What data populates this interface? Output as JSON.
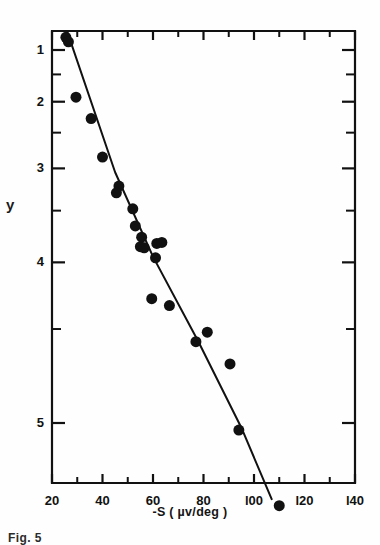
{
  "figure": {
    "kind": "scatter-with-fit-line",
    "background": "#fefefe",
    "ink_color": "#111111",
    "caption_partial": "Fig. 5"
  },
  "axes": {
    "y_label": "y",
    "x_label": "-S ( µv/deg )",
    "x_label_parts": {
      "prefix": "-S (",
      "unit": "µv/deg",
      "suffix": ")"
    },
    "y_tick_labels": [
      "5",
      "4",
      "3",
      "2",
      "1"
    ],
    "x_tick_labels": [
      "20",
      "40",
      "60",
      "80",
      "l00",
      "l20",
      "l40"
    ]
  },
  "chart_data": {
    "type": "scatter",
    "title": "",
    "xlabel": "-S ( µv/deg )",
    "ylabel": "y",
    "xscale": "linear",
    "yscale": "log",
    "xlim": [
      20,
      140
    ],
    "ylim": [
      0.62,
      5.45
    ],
    "grid": false,
    "legend": "none",
    "x_ticks_major": [
      20,
      40,
      60,
      80,
      100,
      120,
      140
    ],
    "x_ticks_minor": [
      30,
      50,
      70,
      90,
      110,
      130
    ],
    "y_ticks_major": [
      1,
      2,
      3,
      4,
      5
    ],
    "y_ticks_minor": [
      1.5,
      2.5,
      3.5,
      4.5
    ],
    "marker": {
      "shape": "circle",
      "color": "#111111",
      "size_px": 11
    },
    "points": [
      {
        "x": 25.5,
        "y": 5.28
      },
      {
        "x": 26.5,
        "y": 5.18
      },
      {
        "x": 29.5,
        "y": 4.08
      },
      {
        "x": 35.5,
        "y": 3.72
      },
      {
        "x": 40.0,
        "y": 3.15
      },
      {
        "x": 46.5,
        "y": 2.78
      },
      {
        "x": 45.5,
        "y": 2.7
      },
      {
        "x": 52.0,
        "y": 2.52
      },
      {
        "x": 53.0,
        "y": 2.34
      },
      {
        "x": 55.5,
        "y": 2.23
      },
      {
        "x": 55.0,
        "y": 2.14
      },
      {
        "x": 56.5,
        "y": 2.13
      },
      {
        "x": 61.5,
        "y": 2.17
      },
      {
        "x": 63.5,
        "y": 2.18
      },
      {
        "x": 61.0,
        "y": 2.04
      },
      {
        "x": 59.5,
        "y": 1.71
      },
      {
        "x": 66.5,
        "y": 1.66
      },
      {
        "x": 81.5,
        "y": 1.48
      },
      {
        "x": 77.0,
        "y": 1.42
      },
      {
        "x": 90.5,
        "y": 1.29
      },
      {
        "x": 94.0,
        "y": 0.97
      },
      {
        "x": 110.0,
        "y": 0.7
      }
    ],
    "fit_line": {
      "style": "solid",
      "color": "#111111",
      "width_px": 2,
      "points": [
        {
          "x": 26.0,
          "y": 5.42
        },
        {
          "x": 45.0,
          "y": 2.95
        },
        {
          "x": 60.0,
          "y": 2.05
        },
        {
          "x": 78.0,
          "y": 1.42
        },
        {
          "x": 95.0,
          "y": 0.98
        },
        {
          "x": 107.0,
          "y": 0.72
        }
      ]
    }
  }
}
